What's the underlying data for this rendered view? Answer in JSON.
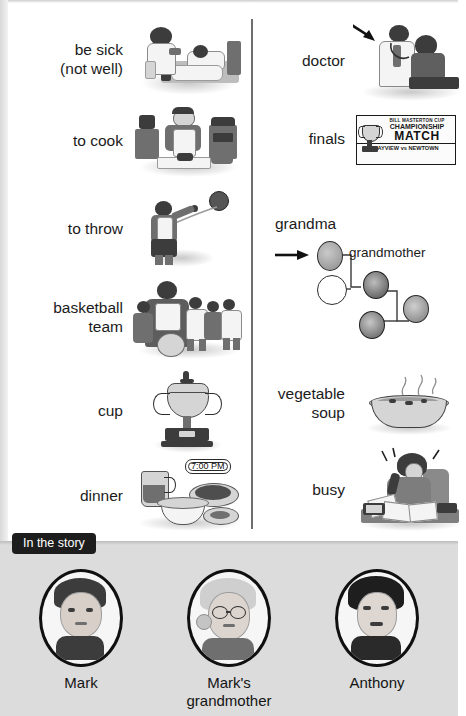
{
  "page": {
    "background": "#ffffff",
    "divider_color": "#6e6e6e"
  },
  "vocabulary": {
    "left_column": [
      {
        "label": "be sick\n(not well)",
        "illustration": "nurse-with-sick-boy-in-bed"
      },
      {
        "label": "to cook",
        "illustration": "man-cooking-at-counter"
      },
      {
        "label": "to throw",
        "illustration": "boy-throwing-basketball"
      },
      {
        "label": "basketball\nteam",
        "illustration": "basketball-team-group-photo"
      },
      {
        "label": "cup",
        "illustration": "trophy-cup"
      },
      {
        "label": "dinner",
        "illustration": "dinner-table-food",
        "annotation": "7:00 PM"
      }
    ],
    "right_column": [
      {
        "label": "doctor",
        "illustration": "doctor-examining-boy",
        "annotation": "arrow-pointing-to-doctor"
      },
      {
        "label": "finals",
        "illustration": "championship-match-poster",
        "poster": {
          "line1": "BILL MASTERTON CUP",
          "line2": "CHAMPIONSHIP",
          "line3": "MATCH",
          "line4": "BAYVIEW vs NEWTOWN"
        }
      },
      {
        "label": "grandma",
        "illustration": "family-tree-diagram",
        "tree_label": "grandmother",
        "annotation": "arrow-pointing-to-grandmother"
      },
      {
        "label": "vegetable\nsoup",
        "illustration": "bowl-of-steaming-soup"
      },
      {
        "label": "busy",
        "illustration": "woman-on-phone-with-papers"
      }
    ]
  },
  "story": {
    "chip_label": "In the story",
    "people": [
      {
        "name": "Mark",
        "portrait": "young-man-portrait"
      },
      {
        "name": "Mark's\ngrandmother",
        "portrait": "elderly-woman-with-glasses-portrait"
      },
      {
        "name": "Anthony",
        "portrait": "boy-with-dark-hair-portrait"
      }
    ]
  }
}
